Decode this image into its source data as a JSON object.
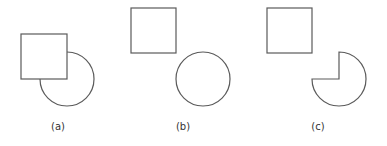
{
  "figure": {
    "panels": [
      {
        "id": "a",
        "label": "(a)",
        "description": "square overlapping a circle (square occludes circle)"
      },
      {
        "id": "b",
        "label": "(b)",
        "description": "square and circle separated"
      },
      {
        "id": "c",
        "label": "(c)",
        "description": "square and circle with a missing quarter (pac-man shape)"
      }
    ],
    "stroke_color": "#5a5a5a",
    "fill_color": "#ffffff"
  }
}
